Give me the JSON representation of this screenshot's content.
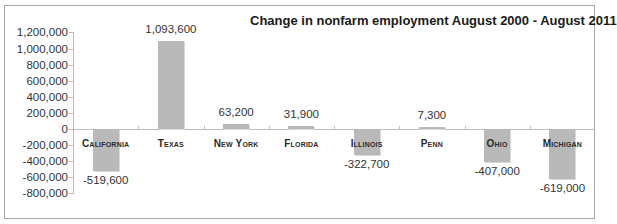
{
  "chart_data": {
    "type": "bar",
    "title": "Change in nonfarm employment August 2000 - August 2011",
    "xlabel": "",
    "ylabel": "",
    "categories": [
      "California",
      "Texas",
      "New York",
      "Florida",
      "Illinois",
      "Penn",
      "Ohio",
      "Michigan"
    ],
    "values": [
      -519600,
      1093600,
      63200,
      31900,
      -322700,
      7300,
      -407000,
      -619000
    ],
    "value_labels": [
      "-519,600",
      "1,093,600",
      "63,200",
      "31,900",
      "-322,700",
      "7,300",
      "-407,000",
      "-619,000"
    ],
    "ylim": [
      -800000,
      1200000
    ],
    "yticks": [
      1200000,
      1000000,
      800000,
      600000,
      400000,
      200000,
      0,
      -200000,
      -400000,
      -600000,
      -800000
    ],
    "ytick_labels": [
      "1,200,000",
      "1,000,000",
      "800,000",
      "600,000",
      "400,000",
      "200,000",
      "0",
      "-200,000",
      "-400,000",
      "-600,000",
      "-800,000"
    ],
    "grid": false,
    "legend": null,
    "bar_color": "#b9b9b9"
  }
}
